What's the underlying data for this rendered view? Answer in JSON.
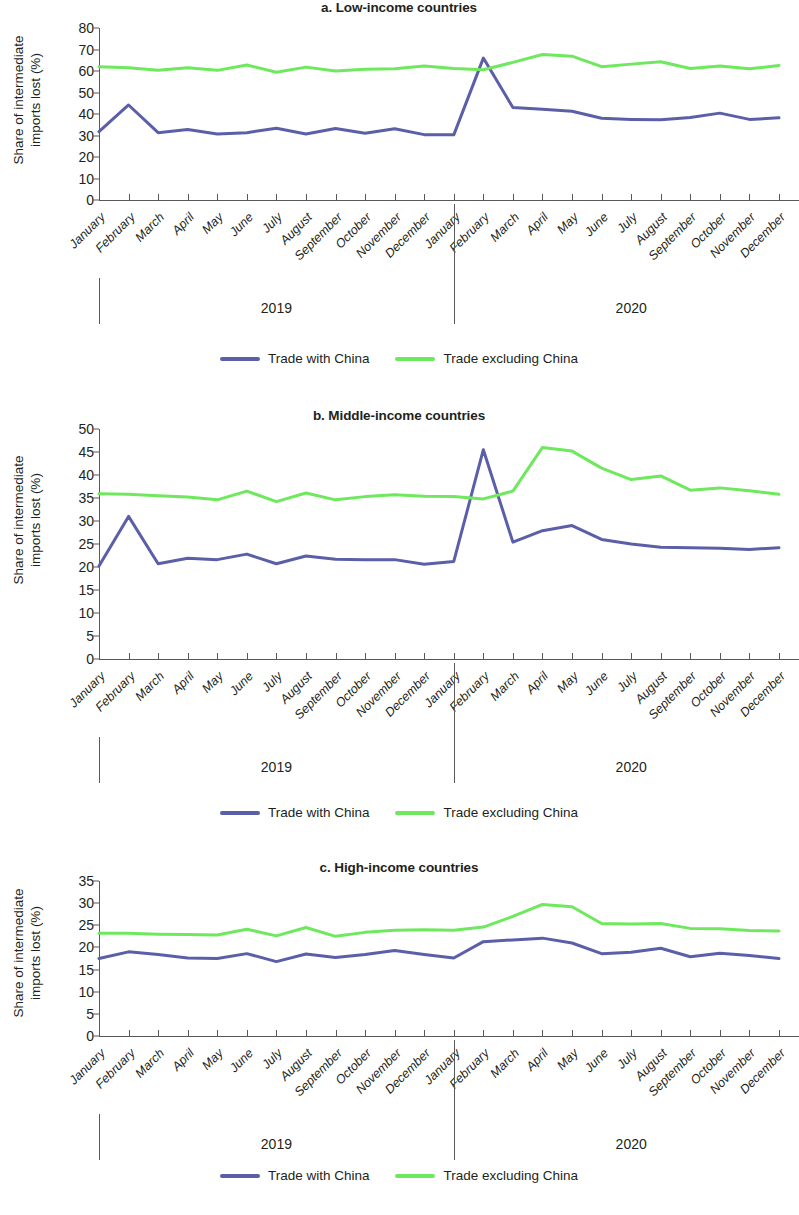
{
  "figure": {
    "ylabel_line1": "Share of intermediate",
    "ylabel_line2": "imports lost (%)",
    "year_left": "2019",
    "year_right": "2020",
    "legend": {
      "series1_label": "Trade with China",
      "series2_label": "Trade excluding China",
      "series1_color": "#5a5fa8",
      "series2_color": "#6ee85c"
    },
    "months": [
      "January",
      "February",
      "March",
      "April",
      "May",
      "June",
      "July",
      "August",
      "September",
      "October",
      "November",
      "December"
    ]
  },
  "chart_data": [
    {
      "type": "line",
      "title": "a. Low-income countries",
      "xlabel": "",
      "ylabel": "Share of intermediate imports lost (%)",
      "ylim": [
        0,
        80
      ],
      "ytick_step": 10,
      "yticks": [
        0,
        10,
        20,
        30,
        40,
        50,
        60,
        70,
        80
      ],
      "grid": false,
      "legend_position": "bottom",
      "x": [
        "January 2019",
        "February 2019",
        "March 2019",
        "April 2019",
        "May 2019",
        "June 2019",
        "July 2019",
        "August 2019",
        "September 2019",
        "October 2019",
        "November 2019",
        "December 2019",
        "January 2020",
        "February 2020",
        "March 2020",
        "April 2020",
        "May 2020",
        "June 2020",
        "July 2020",
        "August 2020",
        "September 2020",
        "October 2020",
        "November 2020",
        "December 2020"
      ],
      "series": [
        {
          "name": "Trade with China",
          "color": "#5a5fa8",
          "values": [
            31.8,
            44.2,
            31.3,
            32.8,
            30.7,
            31.3,
            33.4,
            30.7,
            33.3,
            31.0,
            33.1,
            30.4,
            30.3,
            66.0,
            43.0,
            42.2,
            41.3,
            38.0,
            37.5,
            37.3,
            38.4,
            40.4,
            37.5,
            38.2
          ]
        },
        {
          "name": "Trade excluding China",
          "color": "#6ee85c",
          "values": [
            62.0,
            61.5,
            60.3,
            61.5,
            60.3,
            62.8,
            59.4,
            61.8,
            60.0,
            60.8,
            61.0,
            62.3,
            61.2,
            60.6,
            64.0,
            67.7,
            66.9,
            62.0,
            63.2,
            64.3,
            61.2,
            62.3,
            61.0,
            62.6
          ]
        }
      ]
    },
    {
      "type": "line",
      "title": "b. Middle-income countries",
      "xlabel": "",
      "ylabel": "Share of intermediate imports lost (%)",
      "ylim": [
        0,
        50
      ],
      "ytick_step": 5,
      "yticks": [
        0,
        5,
        10,
        15,
        20,
        25,
        30,
        35,
        40,
        45,
        50
      ],
      "grid": false,
      "legend_position": "bottom",
      "x": [
        "January 2019",
        "February 2019",
        "March 2019",
        "April 2019",
        "May 2019",
        "June 2019",
        "July 2019",
        "August 2019",
        "September 2019",
        "October 2019",
        "November 2019",
        "December 2019",
        "January 2020",
        "February 2020",
        "March 2020",
        "April 2020",
        "May 2020",
        "June 2020",
        "July 2020",
        "August 2020",
        "September 2020",
        "October 2020",
        "November 2020",
        "December 2020"
      ],
      "series": [
        {
          "name": "Trade with China",
          "color": "#5a5fa8",
          "values": [
            20.2,
            31.0,
            20.7,
            21.9,
            21.6,
            22.8,
            20.7,
            22.4,
            21.7,
            21.6,
            21.6,
            20.6,
            21.2,
            45.5,
            25.4,
            27.9,
            29.0,
            26.0,
            25.0,
            24.3,
            24.2,
            24.1,
            23.8,
            24.2
          ]
        },
        {
          "name": "Trade excluding China",
          "color": "#6ee85c",
          "values": [
            35.9,
            35.8,
            35.5,
            35.2,
            34.6,
            36.5,
            34.2,
            36.1,
            34.6,
            35.3,
            35.7,
            35.4,
            35.3,
            34.8,
            36.5,
            46.0,
            45.2,
            41.5,
            39.0,
            39.8,
            36.7,
            37.2,
            36.6,
            35.8
          ]
        }
      ]
    },
    {
      "type": "line",
      "title": "c. High-income countries",
      "xlabel": "",
      "ylabel": "Share of intermediate imports lost (%)",
      "ylim": [
        0,
        35
      ],
      "ytick_step": 5,
      "yticks": [
        0,
        5,
        10,
        15,
        20,
        25,
        30,
        35
      ],
      "grid": false,
      "legend_position": "bottom",
      "x": [
        "January 2019",
        "February 2019",
        "March 2019",
        "April 2019",
        "May 2019",
        "June 2019",
        "July 2019",
        "August 2019",
        "September 2019",
        "October 2019",
        "November 2019",
        "December 2019",
        "January 2020",
        "February 2020",
        "March 2020",
        "April 2020",
        "May 2020",
        "June 2020",
        "July 2020",
        "August 2020",
        "September 2020",
        "October 2020",
        "November 2020",
        "December 2020"
      ],
      "series": [
        {
          "name": "Trade with China",
          "color": "#5a5fa8",
          "values": [
            17.5,
            19.0,
            18.4,
            17.6,
            17.5,
            18.6,
            16.8,
            18.5,
            17.7,
            18.4,
            19.3,
            18.4,
            17.6,
            21.3,
            21.7,
            22.1,
            21.0,
            18.6,
            18.9,
            19.8,
            17.9,
            18.7,
            18.2,
            17.5
          ]
        },
        {
          "name": "Trade excluding China",
          "color": "#6ee85c",
          "values": [
            23.2,
            23.2,
            23.0,
            22.9,
            22.8,
            24.1,
            22.6,
            24.5,
            22.5,
            23.4,
            23.9,
            24.0,
            23.9,
            24.6,
            27.0,
            29.7,
            29.2,
            25.4,
            25.3,
            25.4,
            24.3,
            24.2,
            23.8,
            23.7
          ]
        }
      ]
    }
  ]
}
